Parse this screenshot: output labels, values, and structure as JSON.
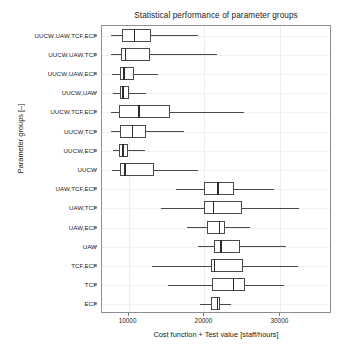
{
  "chart_data": {
    "type": "box",
    "title": "Statistical performance of parameter groups",
    "xlabel": "Cost function + Test value [staff/hours]",
    "ylabel": "Parameter groups [–]",
    "xlim": [
      6500,
      36800
    ],
    "xticks": [
      10000,
      20000,
      30000
    ],
    "xtick_labels": [
      "10000",
      "20000",
      "30000"
    ],
    "grid": true,
    "legend": "none",
    "orientation": "horizontal",
    "categories": [
      "UUCW,UAW,TCF,ECF",
      "UUCW,UAW,TCF",
      "UUCW,UAW,ECF",
      "UUCW,UAW",
      "UUCW,TCF,ECF",
      "UUCW,TCF",
      "UUCW,ECF",
      "UUCW",
      "UAW,TCF,ECF",
      "UAW,TCF",
      "UAW,ECF",
      "UAW",
      "TCF,ECF",
      "TCF",
      "ECF"
    ],
    "boxes": [
      {
        "category": "UUCW,UAW,TCF,ECF",
        "whisker_low": 7700,
        "q1": 9100,
        "median": 10700,
        "q3": 13000,
        "whisker_high": 19100
      },
      {
        "category": "UUCW,UAW,TCF",
        "whisker_low": 7700,
        "q1": 9000,
        "median": 9500,
        "q3": 12800,
        "whisker_high": 21600
      },
      {
        "category": "UUCW,UAW,ECF",
        "whisker_low": 7800,
        "q1": 8900,
        "median": 9300,
        "q3": 10700,
        "whisker_high": 13900
      },
      {
        "category": "UUCW,UAW",
        "whisker_low": 8000,
        "q1": 8900,
        "median": 9200,
        "q3": 10100,
        "whisker_high": 12300
      },
      {
        "category": "UUCW,TCF,ECF",
        "whisker_low": 7700,
        "q1": 8800,
        "median": 11300,
        "q3": 15400,
        "whisker_high": 25200
      },
      {
        "category": "UUCW,TCF",
        "whisker_low": 7700,
        "q1": 8900,
        "median": 10400,
        "q3": 12300,
        "whisker_high": 17300
      },
      {
        "category": "UUCW,ECF",
        "whisker_low": 8000,
        "q1": 8800,
        "median": 9200,
        "q3": 9900,
        "whisker_high": 12200
      },
      {
        "category": "UUCW",
        "whisker_low": 7800,
        "q1": 8900,
        "median": 9400,
        "q3": 13300,
        "whisker_high": 19100
      },
      {
        "category": "UAW,TCF,ECF",
        "whisker_low": 16200,
        "q1": 20000,
        "median": 21700,
        "q3": 23900,
        "whisker_high": 29200
      },
      {
        "category": "UAW,TCF",
        "whisker_low": 14300,
        "q1": 19900,
        "median": 21100,
        "q3": 25000,
        "whisker_high": 32400
      },
      {
        "category": "UAW,ECF",
        "whisker_low": 17700,
        "q1": 20300,
        "median": 21900,
        "q3": 22700,
        "whisker_high": 26000
      },
      {
        "category": "UAW",
        "whisker_low": 19100,
        "q1": 21200,
        "median": 22100,
        "q3": 24700,
        "whisker_high": 30800
      },
      {
        "category": "TCF,ECF",
        "whisker_low": 13100,
        "q1": 20800,
        "median": 21200,
        "q3": 25100,
        "whisker_high": 32300
      },
      {
        "category": "TCF",
        "whisker_low": 15200,
        "q1": 21000,
        "median": 23700,
        "q3": 25300,
        "whisker_high": 30500
      },
      {
        "category": "ECF",
        "whisker_low": 19400,
        "q1": 20900,
        "median": 21600,
        "q3": 22100,
        "whisker_high": 23500
      }
    ],
    "colors": {
      "box_edge": "#4a4a4a",
      "median": "#2b2b2b",
      "whisker": "#4a4a4a",
      "grid": "#ededf0",
      "frame": "#8e8e8e",
      "background": "#ffffff",
      "text": "#1a1a1a"
    }
  }
}
